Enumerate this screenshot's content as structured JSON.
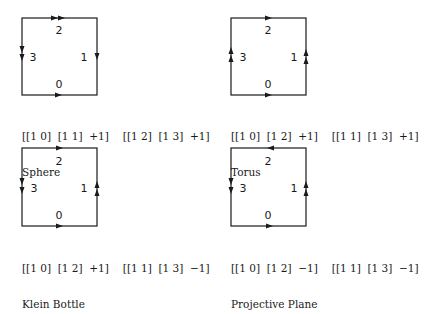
{
  "diagrams": [
    {
      "name": "Sphere",
      "edge_labels": {
        "top": "2",
        "right": "1",
        "bottom": "0",
        "left": "3"
      },
      "arrows": {
        "top": "right-double",
        "right": "down-single",
        "bottom": "right-single",
        "left": "down-double"
      },
      "generators": [
        "[[1 0]  [1 1]  +1]",
        "[[1 2]  [1 3]  +1]"
      ]
    },
    {
      "name": "Torus",
      "edge_labels": {
        "top": "2",
        "right": "1",
        "bottom": "0",
        "left": "3"
      },
      "arrows": {
        "top": "right-single",
        "right": "up-double",
        "bottom": "right-single",
        "left": "up-double"
      },
      "generators": [
        "[[1 0]  [1 2]  +1]",
        "[[1 1]  [1 3]  +1]"
      ]
    },
    {
      "name": "Klein Bottle",
      "edge_labels": {
        "top": "2",
        "right": "1",
        "bottom": "0",
        "left": "3"
      },
      "arrows": {
        "top": "right-single",
        "right": "up-double",
        "bottom": "right-single",
        "left": "down-double"
      },
      "generators": [
        "[[1 0]  [1 2]  +1]",
        "[[1 1]  [1 3]  −1]"
      ]
    },
    {
      "name": "Projective Plane",
      "edge_labels": {
        "top": "2",
        "right": "1",
        "bottom": "0",
        "left": "3"
      },
      "arrows": {
        "top": "left-single",
        "right": "up-double",
        "bottom": "right-single",
        "left": "down-double"
      },
      "generators": [
        "[[1 0]  [1 2]  −1]",
        "[[1 1]  [1 3]  −1]"
      ]
    }
  ]
}
